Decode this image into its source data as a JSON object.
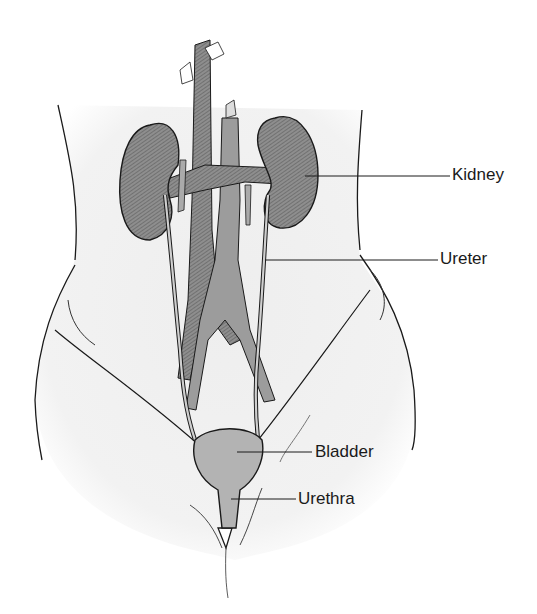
{
  "diagram": {
    "colors": {
      "organ_fill": "#8a8a8a",
      "vessel_fill": "#9a9a9a",
      "bladder_fill": "#b5b5b5",
      "skin_fill": "#f1f1f1",
      "outline": "#1a1a1a",
      "label_text": "#1a1a1a"
    },
    "labels": [
      {
        "id": "kidney",
        "text": "Kidney"
      },
      {
        "id": "ureter",
        "text": "Ureter"
      },
      {
        "id": "bladder",
        "text": "Bladder"
      },
      {
        "id": "urethra",
        "text": "Urethra"
      }
    ]
  }
}
